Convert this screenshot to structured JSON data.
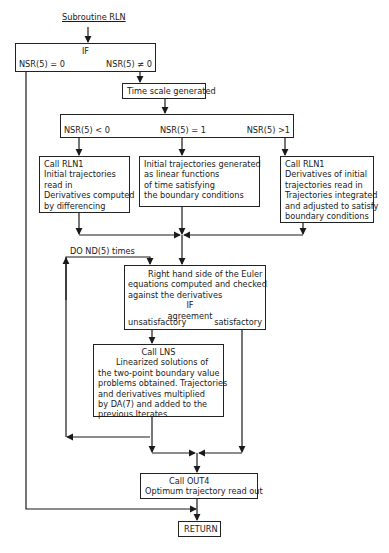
{
  "title": "Subroutine RLN",
  "if1": {
    "label": "IF",
    "left_branch": "NSR(5) = 0",
    "right_branch": "NSR(5) ≠ 0"
  },
  "time_scale": "Time scale generated",
  "if2": {
    "branches": [
      "NSR(5) < 0",
      "NSR(5) = 1",
      "NSR(5) >1"
    ]
  },
  "box_left": {
    "lines": [
      "Call RLN1",
      "Initial trajectories",
      "read in",
      "Derivatives computed",
      "by differencing"
    ]
  },
  "box_middle": {
    "lines": [
      "Initial trajectories generated",
      "as linear functions",
      "of time satisfying",
      "the boundary  conditions"
    ]
  },
  "box_right": {
    "lines": [
      "Call RLN1",
      "Derivatives of initial",
      "trajectories read in",
      "Trajectories integrated",
      "and adjusted to satisfy",
      "boundary conditions"
    ]
  },
  "loop_label": "DO  ND(5) times",
  "euler_box": {
    "lines": [
      "Right hand side of the Euler",
      "equations computed and checked",
      "against the derivatives"
    ],
    "if_label": "IF",
    "condition": "agreement",
    "unsatisfactory": "unsatisfactory",
    "satisfactory": "satisfactory"
  },
  "lns_box": {
    "lines": [
      "Call LNS",
      "Linearized solutions of",
      "the two-point boundary value",
      "problems obtained.  Trajectories",
      "and derivatives multiplied",
      "by DA(7) and added to the",
      "previous  Iterates"
    ]
  },
  "out4_box": {
    "lines": [
      "Call OUT4",
      "Optimum trajectory read out"
    ]
  },
  "return_label": "RETURN"
}
